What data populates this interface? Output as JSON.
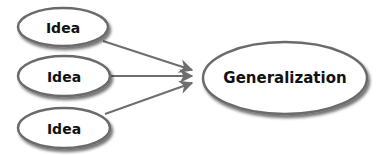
{
  "diagram": {
    "ideas": [
      {
        "label": "Idea",
        "cx": 63,
        "cy": 27,
        "rx": 45,
        "ry": 19
      },
      {
        "label": "Idea",
        "cx": 64,
        "cy": 76,
        "rx": 46,
        "ry": 20
      },
      {
        "label": "Idea",
        "cx": 64,
        "cy": 128,
        "rx": 46,
        "ry": 20
      }
    ],
    "generalization": {
      "label": "Generalization",
      "cx": 285,
      "cy": 78,
      "rx": 82,
      "ry": 36
    },
    "arrows": [
      {
        "from": "idea-1",
        "to": "generalization",
        "x1": 103,
        "y1": 41,
        "x2": 192,
        "y2": 70
      },
      {
        "from": "idea-2",
        "to": "generalization",
        "x1": 110,
        "y1": 76,
        "x2": 192,
        "y2": 76
      },
      {
        "from": "idea-3",
        "to": "generalization",
        "x1": 105,
        "y1": 114,
        "x2": 192,
        "y2": 83
      }
    ],
    "colors": {
      "stroke": "#6b6b6b",
      "arrow": "#6e6e6e",
      "fill": "#ffffff",
      "shadow": "#9a9a9a",
      "text": "#111111"
    }
  }
}
